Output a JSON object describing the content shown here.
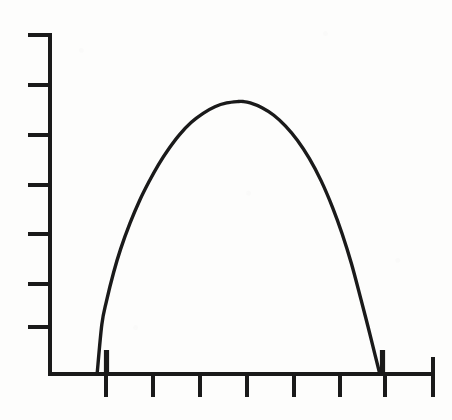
{
  "figure": {
    "kind": "line-plot",
    "background_color": "#fdfdfc",
    "ink_color": "#1a1a1a",
    "title": "",
    "subtitle": "",
    "caption": ""
  },
  "axes": {
    "origin_px": {
      "x": 50,
      "y": 374
    },
    "y_axis": {
      "label": "",
      "line_x_px": 50,
      "top_px": 34,
      "bottom_px": 374,
      "stroke_width_px": 4,
      "tick_length_px": 22,
      "tick_side": "left",
      "tick_count": 7,
      "tick_positions_px": [
        35,
        85,
        135,
        185,
        234,
        284,
        327
      ],
      "tick_labels": [
        "",
        "",
        "",
        "",
        "",
        "",
        ""
      ]
    },
    "x_axis": {
      "label": "",
      "line_y_px": 374,
      "left_px": 50,
      "right_px": 434,
      "stroke_width_px": 4,
      "tick_length_px": 22,
      "tick_side": "below",
      "tick_count": 8,
      "tick_positions_px": [
        106,
        153,
        200,
        247,
        294,
        340,
        385,
        433
      ],
      "tick_labels": [
        "",
        "",
        "",
        "",
        "",
        "",
        "",
        ""
      ]
    }
  },
  "curve": {
    "stroke_width_px": 3.4,
    "stroke_color": "#1a1a1a",
    "fill": "none",
    "shape": "dome",
    "start_px": {
      "x": 106,
      "y": 374
    },
    "peak_px": {
      "x": 243,
      "y": 101
    },
    "end_px": {
      "x": 383,
      "y": 374
    },
    "base_stub_left": {
      "x": 106,
      "y_top": 350,
      "y_bottom": 374
    },
    "base_stub_right": {
      "x": 383,
      "y_top": 350,
      "y_bottom": 374
    }
  },
  "chart_data": {
    "type": "line",
    "title": "",
    "xlabel": "",
    "ylabel": "",
    "grid": false,
    "legend": null,
    "legend_position": "none",
    "axis_tick_labels_shown": false,
    "x_tick_values": [
      1,
      2,
      3,
      4,
      5,
      6,
      7,
      8
    ],
    "y_tick_values": [
      1,
      2,
      3,
      4,
      5,
      6,
      7
    ],
    "xlim": [
      0,
      8.15
    ],
    "ylim": [
      0,
      7.2
    ],
    "series": [
      {
        "name": "curve",
        "x": [
          1.0,
          1.1,
          1.2,
          1.35,
          1.5,
          1.7,
          1.9,
          2.1,
          2.3,
          2.5,
          2.75,
          3.0,
          3.25,
          3.5,
          3.75,
          4.0,
          4.1,
          4.25,
          4.5,
          4.75,
          5.0,
          5.25,
          5.5,
          5.75,
          6.0,
          6.2,
          6.4,
          6.6,
          6.75,
          6.9,
          7.0
        ],
        "y": [
          0.0,
          1.05,
          1.55,
          2.15,
          2.65,
          3.2,
          3.67,
          4.07,
          4.43,
          4.74,
          5.07,
          5.33,
          5.52,
          5.66,
          5.74,
          5.77,
          5.77,
          5.74,
          5.64,
          5.48,
          5.25,
          4.95,
          4.57,
          4.1,
          3.52,
          2.97,
          2.33,
          1.58,
          1.0,
          0.4,
          0.0
        ]
      }
    ],
    "annotations": [
      {
        "text": "",
        "type": "left-base-stub",
        "x": 1.0,
        "y": 0.5
      },
      {
        "text": "",
        "type": "right-base-stub",
        "x": 7.0,
        "y": 0.5
      }
    ]
  }
}
